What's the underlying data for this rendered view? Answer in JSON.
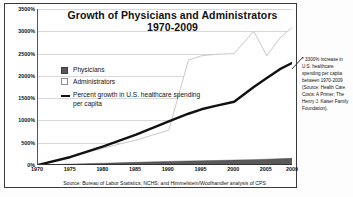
{
  "figure": {
    "title_line1": "Growth of Physicians and Administrators",
    "title_line2": "1970-2009",
    "source_caption": "Source: Bureau of Labor Statistics; NCHS; and Himmelstein/Woolhandler analysis of CPS",
    "annotation": "* 3300% increase in U.S. healthcare spending per capita between 1970-2009 (Source: Health Care Costs: A Primer; The Henry J. Kaiser Family Foundation).",
    "stray_text": "",
    "colors": {
      "physicians": "#595959",
      "administrators": "#ffffff",
      "administrators_edge": "#bdbdbd",
      "spending_line": "#111111",
      "grid": "#d8d8d8",
      "axis": "#333333",
      "frame": "#3a3a3a"
    }
  },
  "chart_data": {
    "type": "area",
    "title": "Growth of Physicians and Administrators 1970-2009",
    "subtitle": "1970-2009",
    "xlabel": "",
    "ylabel": "",
    "grid": true,
    "legend_position": "inside-left",
    "xlim": [
      1970,
      2009
    ],
    "ylim": [
      0,
      3500
    ],
    "ytick_labels": [
      "0%",
      "500%",
      "1000%",
      "1500%",
      "2000%",
      "2500%",
      "3000%",
      "3500%"
    ],
    "ytick_values": [
      0,
      500,
      1000,
      1500,
      2000,
      2500,
      3000,
      3500
    ],
    "xtick_labels": [
      "1970",
      "1975",
      "1980",
      "1985",
      "1990",
      "1995",
      "2000",
      "2005",
      "2009"
    ],
    "xtick_values": [
      1970,
      1975,
      1980,
      1985,
      1990,
      1995,
      2000,
      2005,
      2009
    ],
    "x": [
      1970,
      1975,
      1980,
      1985,
      1990,
      1993,
      1995,
      1997,
      2000,
      2003,
      2005,
      2007,
      2009
    ],
    "series": [
      {
        "name": "Physicians",
        "type": "area",
        "color": "#595959",
        "values": [
          0,
          20,
          40,
          60,
          80,
          90,
          95,
          100,
          110,
          120,
          130,
          140,
          150
        ]
      },
      {
        "name": "Administrators",
        "type": "area",
        "color": "#ffffff",
        "values": [
          0,
          180,
          380,
          560,
          780,
          2350,
          2450,
          2480,
          2500,
          3000,
          2450,
          2850,
          3100
        ]
      },
      {
        "name": "Percent growth in U.S. healthcare spending per capita",
        "type": "line",
        "color": "#111111",
        "values": [
          0,
          180,
          420,
          680,
          980,
          1150,
          1250,
          1320,
          1420,
          1750,
          1950,
          2150,
          2300
        ]
      }
    ]
  },
  "legend": {
    "items": [
      {
        "label": "Physicians",
        "swatch": "filled-dark"
      },
      {
        "label": "Administrators",
        "swatch": "outline-white"
      },
      {
        "label": "Percent growth in U.S. healthcare spending per capita",
        "swatch": "line-black"
      }
    ]
  }
}
